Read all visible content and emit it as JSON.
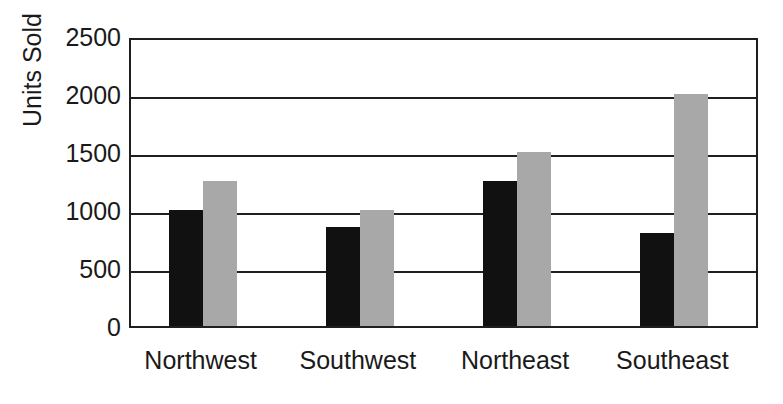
{
  "chart_data": {
    "type": "bar",
    "title": "",
    "subtitle": "",
    "xlabel": "",
    "ylabel": "Units Sold",
    "ylim": [
      0,
      2500
    ],
    "ytick_values": [
      0,
      500,
      1000,
      1500,
      2000,
      2500
    ],
    "ytick_labels": [
      "0",
      "500",
      "1000",
      "1500",
      "2000",
      "2500"
    ],
    "categories": [
      "Northwest",
      "Southwest",
      "Northeast",
      "Southeast"
    ],
    "series": [
      {
        "name": "series-1",
        "color": "#111111",
        "values": [
          1000,
          850,
          1250,
          800
        ]
      },
      {
        "name": "series-2",
        "color": "#a8a8a8",
        "values": [
          1250,
          1000,
          1500,
          2000
        ]
      }
    ],
    "grid": true,
    "legend": false,
    "legend_position": "none",
    "annotations": []
  },
  "colors": {
    "axis": "#1f1f1f",
    "background": "#ffffff",
    "series_black": "#111111",
    "series_gray": "#a8a8a8"
  }
}
